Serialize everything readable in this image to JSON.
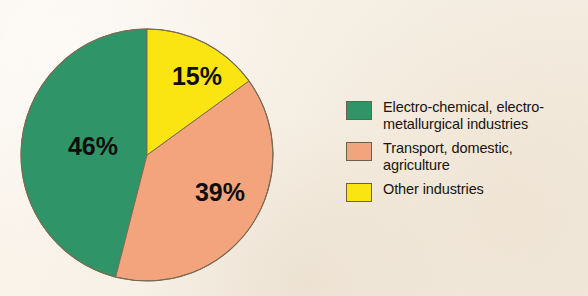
{
  "background_color": "#f7f0e6",
  "chart_data": {
    "type": "pie",
    "title": "",
    "subtitle": "",
    "xlabel": "",
    "ylabel": "",
    "unit": "%",
    "start_angle_deg": 0,
    "direction": "mixed",
    "legend_position": "right",
    "grid": false,
    "categories": [
      "Electro-chemical, electro-metallurgical industries",
      "Transport, domestic, agriculture",
      "Other industries"
    ],
    "values": [
      46,
      39,
      15
    ],
    "slices": [
      {
        "label": "Electro-chemical, electro-metallurgical industries",
        "legend_label": "Electro-chemical, electro-\nmetallurgical industries",
        "value": 46,
        "data_label": "46%",
        "color": "#2f9468",
        "start_angle_deg": 0,
        "end_angle_deg": -165.6
      },
      {
        "label": "Transport, domestic, agriculture",
        "legend_label": "Transport, domestic,\nagriculture",
        "value": 39,
        "data_label": "39%",
        "color": "#f4a47c",
        "start_angle_deg": 54,
        "end_angle_deg": 194.4
      },
      {
        "label": "Other industries",
        "legend_label": "Other industries",
        "value": 15,
        "data_label": "15%",
        "color": "#fae513",
        "start_angle_deg": 0,
        "end_angle_deg": 54
      }
    ]
  },
  "pie": {
    "center_x": 127,
    "center_y": 127,
    "radius": 126,
    "outline_color": "#7a6a55",
    "labels": [
      {
        "text": "46%",
        "x": 73,
        "y": 120
      },
      {
        "text": "39%",
        "x": 200,
        "y": 166
      },
      {
        "text": "15%",
        "x": 177,
        "y": 50
      }
    ]
  },
  "legend": {
    "items": [
      {
        "swatch_name": "legend-swatch-green",
        "color": "#2f9468",
        "label": "Electro-chemical, electro-\nmetallurgical industries"
      },
      {
        "swatch_name": "legend-swatch-salmon",
        "color": "#f4a47c",
        "label": "Transport, domestic,\nagriculture"
      },
      {
        "swatch_name": "legend-swatch-yellow",
        "color": "#fae513",
        "label": "Other industries"
      }
    ]
  }
}
